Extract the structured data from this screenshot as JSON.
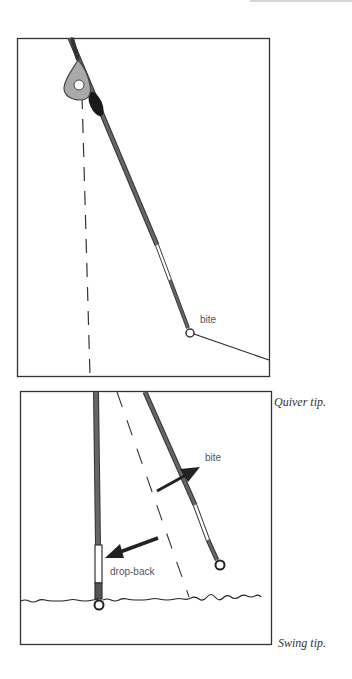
{
  "figure": {
    "panels": [
      {
        "id": "quiver-tip",
        "caption": "Quiver tip.",
        "labels": {
          "bite": "bite"
        }
      },
      {
        "id": "swing-tip",
        "caption": "Swing tip.",
        "labels": {
          "bite": "bite",
          "drop_back": "drop-back"
        }
      }
    ]
  },
  "colors": {
    "rod": "#555555",
    "rod_dark": "#222222",
    "frame": "#333333",
    "ring_grey": "#9a9a9a"
  }
}
